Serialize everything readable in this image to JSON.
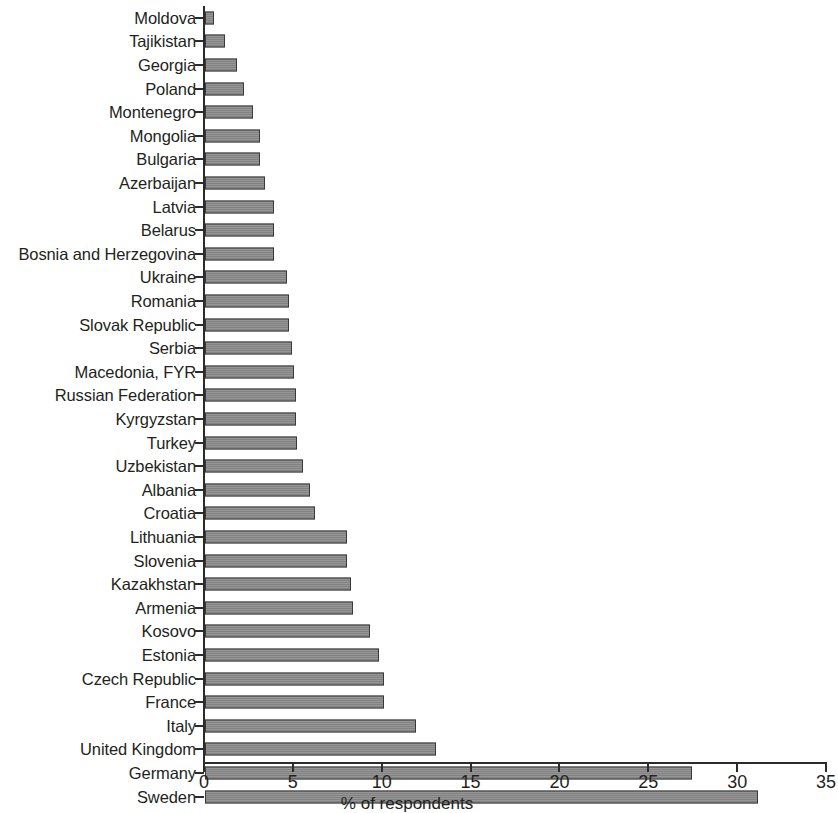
{
  "chart_data": {
    "type": "bar",
    "orientation": "horizontal",
    "title": "",
    "subtitle": "",
    "xlabel": "% of respondents",
    "ylabel": "",
    "xlim": [
      0,
      35
    ],
    "ylim": null,
    "grid": false,
    "legend": null,
    "legend_position": "none",
    "x_ticks": [
      0,
      5,
      10,
      15,
      20,
      25,
      30,
      35
    ],
    "x_tick_labels": [
      "0",
      "5",
      "10",
      "15",
      "20",
      "25",
      "30",
      "35"
    ],
    "bar_color": "#8a8a8a",
    "bar_edge_color": "#3a3a3a",
    "axis_color": "#2b2b2b",
    "background_color": "#ffffff",
    "categories": [
      "Moldova",
      "Tajikistan",
      "Georgia",
      "Poland",
      "Montenegro",
      "Mongolia",
      "Bulgaria",
      "Azerbaijan",
      "Latvia",
      "Belarus",
      "Bosnia and Herzegovina",
      "Ukraine",
      "Romania",
      "Slovak Republic",
      "Serbia",
      "Macedonia, FYR",
      "Russian Federation",
      "Kyrgyzstan",
      "Turkey",
      "Uzbekistan",
      "Albania",
      "Croatia",
      "Lithuania",
      "Slovenia",
      "Kazakhstan",
      "Armenia",
      "Kosovo",
      "Estonia",
      "Czech Republic",
      "France",
      "Italy",
      "United Kingdom",
      "Germany",
      "Sweden"
    ],
    "values": [
      0.5,
      1.1,
      1.8,
      2.2,
      2.7,
      3.1,
      3.1,
      3.4,
      3.9,
      3.9,
      3.9,
      4.6,
      4.7,
      4.7,
      4.9,
      5.0,
      5.1,
      5.1,
      5.2,
      5.5,
      5.9,
      6.2,
      8.0,
      8.0,
      8.2,
      8.3,
      9.3,
      9.8,
      10.1,
      10.1,
      11.9,
      13.0,
      27.4,
      31.1
    ]
  }
}
